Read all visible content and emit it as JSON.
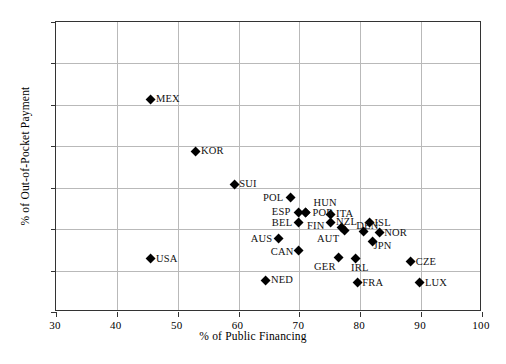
{
  "chart_data": {
    "type": "scatter",
    "title": "",
    "xlabel": "% of Public Financing",
    "ylabel": "% of Out-of-Pocket Payment",
    "xlim": [
      30,
      100
    ],
    "ylim": [
      0,
      70
    ],
    "xticks": [
      30,
      40,
      50,
      60,
      70,
      80,
      90,
      100
    ],
    "yticks": [
      0,
      10,
      20,
      30,
      40,
      50,
      60,
      70
    ],
    "grid": true,
    "legend": "none",
    "marker": "diamond",
    "marker_color": "#000000",
    "points": [
      {
        "label": "MEX",
        "x": 45.6,
        "y": 51.3,
        "lx": 6,
        "ly": -4
      },
      {
        "label": "KOR",
        "x": 53.0,
        "y": 38.8,
        "lx": 6,
        "ly": -4
      },
      {
        "label": "SUI",
        "x": 59.3,
        "y": 30.8,
        "lx": 6,
        "ly": -4
      },
      {
        "label": "USA",
        "x": 45.6,
        "y": 12.8,
        "lx": 6,
        "ly": -4
      },
      {
        "label": "POL",
        "x": 68.6,
        "y": 27.5,
        "lx": -27,
        "ly": -4
      },
      {
        "label": "HUN",
        "x": 71.0,
        "y": 24.1,
        "lx": 9,
        "ly": -13
      },
      {
        "label": "ESP",
        "x": 69.9,
        "y": 24.1,
        "lx": -26,
        "ly": -4
      },
      {
        "label": "POR",
        "x": 71.0,
        "y": 24.1,
        "lx": 8,
        "ly": -3
      },
      {
        "label": "ITA",
        "x": 75.2,
        "y": 23.6,
        "lx": 6,
        "ly": -4
      },
      {
        "label": "BEL",
        "x": 69.9,
        "y": 21.5,
        "lx": -26,
        "ly": -4
      },
      {
        "label": "FIN",
        "x": 75.2,
        "y": 21.5,
        "lx": -23,
        "ly": -1
      },
      {
        "label": "AUS",
        "x": 66.6,
        "y": 17.7,
        "lx": -27,
        "ly": -4
      },
      {
        "label": "NZL",
        "x": 77.0,
        "y": 20.3,
        "lx": -5,
        "ly": -10
      },
      {
        "label": "ISL",
        "x": 81.5,
        "y": 21.5,
        "lx": 6,
        "ly": -4
      },
      {
        "label": "DEN",
        "x": 80.5,
        "y": 19.3,
        "lx": -6,
        "ly": -10
      },
      {
        "label": "NOR",
        "x": 83.1,
        "y": 19.1,
        "lx": 6,
        "ly": -4
      },
      {
        "label": "AUT",
        "x": 77.5,
        "y": 19.6,
        "lx": -27,
        "ly": 4
      },
      {
        "label": "CAN",
        "x": 69.9,
        "y": 14.8,
        "lx": -27,
        "ly": -3
      },
      {
        "label": "JPN",
        "x": 82.0,
        "y": 17.1,
        "lx": 2,
        "ly": 1
      },
      {
        "label": "GER",
        "x": 76.5,
        "y": 13.1,
        "lx": -24,
        "ly": 5
      },
      {
        "label": "IRL",
        "x": 79.3,
        "y": 12.8,
        "lx": -4,
        "ly": 5
      },
      {
        "label": "CZE",
        "x": 88.3,
        "y": 12.1,
        "lx": 6,
        "ly": -4
      },
      {
        "label": "NED",
        "x": 64.5,
        "y": 7.7,
        "lx": 6,
        "ly": -4
      },
      {
        "label": "FRA",
        "x": 79.5,
        "y": 7.0,
        "lx": 6,
        "ly": -4
      },
      {
        "label": "LUX",
        "x": 89.8,
        "y": 7.0,
        "lx": 6,
        "ly": -4
      }
    ]
  },
  "caption": ""
}
